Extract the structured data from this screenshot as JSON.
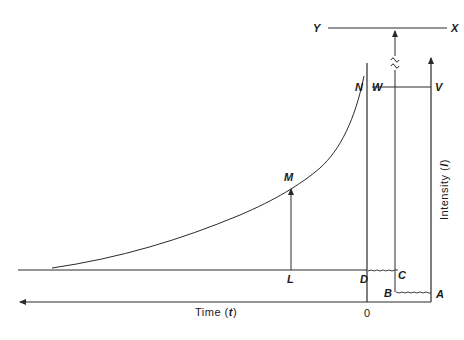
{
  "diagram": {
    "type": "intensity-time schematic",
    "colors": {
      "ink": "#2a2a2a",
      "background": "#ffffff"
    },
    "axes": {
      "x_title": "Time (",
      "x_title_var": "t",
      "x_title_end": ")",
      "x_origin_label": "0",
      "y_title": "Intensity (",
      "y_title_var": "I",
      "y_title_end": ")"
    },
    "points": {
      "A": "A",
      "B": "B",
      "C": "C",
      "D": "D",
      "L": "L",
      "M": "M",
      "N": "N",
      "V": "V",
      "W": "W",
      "X": "X",
      "Y": "Y"
    },
    "break_symbol": "~"
  }
}
